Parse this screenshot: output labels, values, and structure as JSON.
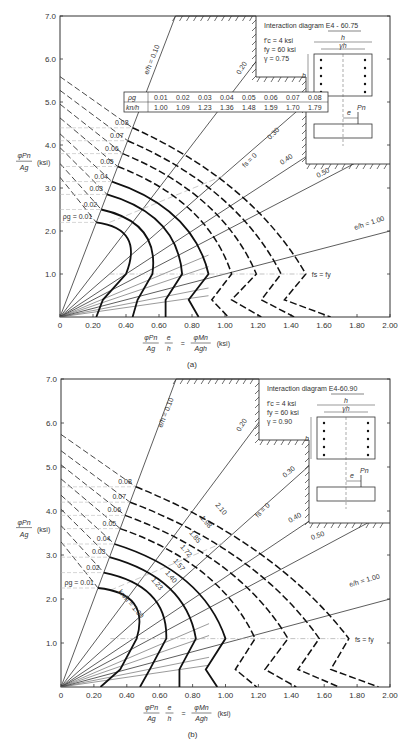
{
  "chart_data": [
    {
      "id": "a",
      "type": "line",
      "caption": "(a)",
      "title": "Interaction diagram E4 - 60.75",
      "params": [
        "f'c = 4 ksi",
        "fy = 60 ksi",
        "γ = 0.75"
      ],
      "xlabel": "φPn/Ag · e/h = φMn/(Ag h) (ksi)",
      "ylabel": "φPn/Ag (ksi)",
      "xlim": [
        0,
        2.0
      ],
      "ylim": [
        0,
        7.0
      ],
      "xticks": [
        "0",
        "0.20",
        "0.40",
        "0.60",
        "0.80",
        "1.00",
        "1.20",
        "1.40",
        "1.60",
        "1.80",
        "2.00"
      ],
      "yticks": [
        "1.0",
        "2.0",
        "3.0",
        "4.0",
        "5.0",
        "6.0",
        "7.0"
      ],
      "eh_lines": [
        {
          "label": "e/h = 0.10",
          "slope": 10.0
        },
        {
          "label": "0.20",
          "slope": 5.0
        },
        {
          "label": "0.30",
          "slope": 3.333
        },
        {
          "label": "0.40",
          "slope": 2.5
        },
        {
          "label": "0.50",
          "slope": 2.0
        },
        {
          "label": "e/h = 1.00",
          "slope": 1.0
        }
      ],
      "fs_zero_label": "fs = 0",
      "fs_fy_label": "fs = fy",
      "rho_table": {
        "rho_g": [
          "0.01",
          "0.02",
          "0.03",
          "0.04",
          "0.05",
          "0.06",
          "0.07",
          "0.08"
        ],
        "kn_h": [
          "1.00",
          "1.09",
          "1.23",
          "1.36",
          "1.48",
          "1.59",
          "1.70",
          "1.79"
        ]
      },
      "series": [
        {
          "name": "ρg = 0.01",
          "pmax": 2.2,
          "top": [
            0.22,
            2.2
          ],
          "knee": [
            0.4,
            1.0
          ],
          "low": [
            0.26,
            0.4
          ],
          "bottom": [
            0.22,
            0
          ]
        },
        {
          "name": "0.02",
          "pmax": 2.5,
          "top": [
            0.25,
            2.5
          ],
          "knee": [
            0.56,
            1.0
          ],
          "low": [
            0.47,
            0.4
          ],
          "bottom": [
            0.44,
            0
          ]
        },
        {
          "name": "0.03",
          "pmax": 2.85,
          "top": [
            0.285,
            2.85
          ],
          "knee": [
            0.74,
            1.0
          ],
          "low": [
            0.64,
            0.4
          ],
          "bottom": [
            0.64,
            0
          ]
        },
        {
          "name": "0.04",
          "pmax": 3.15,
          "top": [
            0.315,
            3.15
          ],
          "knee": [
            0.9,
            1.0
          ],
          "low": [
            0.78,
            0.4
          ],
          "bottom": [
            0.84,
            0
          ]
        },
        {
          "name": "0.05",
          "pmax": 3.5,
          "top": [
            0.35,
            3.5
          ],
          "knee": [
            1.04,
            1.0
          ],
          "low": [
            0.92,
            0.4
          ],
          "bottom": [
            1.02,
            0
          ]
        },
        {
          "name": "0.06",
          "pmax": 3.8,
          "top": [
            0.38,
            3.8
          ],
          "knee": [
            1.19,
            1.0
          ],
          "low": [
            1.04,
            0.4
          ],
          "bottom": [
            1.22,
            0
          ]
        },
        {
          "name": "0.07",
          "pmax": 4.1,
          "top": [
            0.41,
            4.1
          ],
          "knee": [
            1.34,
            1.0
          ],
          "low": [
            1.22,
            0.4
          ],
          "bottom": [
            1.42,
            0
          ]
        },
        {
          "name": "0.08",
          "pmax": 4.4,
          "top": [
            0.44,
            4.4
          ],
          "knee": [
            1.49,
            1.0
          ],
          "low": [
            1.36,
            0.4
          ],
          "bottom": [
            1.64,
            0
          ]
        }
      ],
      "kn_labels": []
    },
    {
      "id": "b",
      "type": "line",
      "caption": "(b)",
      "title": "Interaction diagram E4-60.90",
      "params": [
        "f'c = 4 ksi",
        "fy = 60 ksi",
        "γ = 0.90"
      ],
      "xlabel": "φPn/Ag · e/h = φMn/(Ag h) (ksi)",
      "ylabel": "φPn/Ag (ksi)",
      "xlim": [
        0,
        2.0
      ],
      "ylim": [
        0,
        7.0
      ],
      "xticks": [
        "0",
        "0.20",
        "0.40",
        "0.60",
        "0.80",
        "1.00",
        "1.20",
        "1.40",
        "1.60",
        "1.80",
        "2.00"
      ],
      "yticks": [
        "1.0",
        "2.0",
        "3.0",
        "4.0",
        "5.0",
        "6.0",
        "7.0"
      ],
      "eh_lines": [
        {
          "label": "e/h = 0.10",
          "slope": 10.0
        },
        {
          "label": "0.20",
          "slope": 5.0
        },
        {
          "label": "0.30",
          "slope": 3.333
        },
        {
          "label": "0.40",
          "slope": 2.5
        },
        {
          "label": "0.50",
          "slope": 2.0
        },
        {
          "label": "e/h = 1.00",
          "slope": 1.0
        }
      ],
      "fs_zero_label": "fs = 0",
      "fs_fy_label": "fs = fy",
      "rho_table": null,
      "series": [
        {
          "name": "ρg = 0.01",
          "pmax": 2.25,
          "top": [
            0.225,
            2.25
          ],
          "knee": [
            0.46,
            1.1
          ],
          "low": [
            0.36,
            0.4
          ],
          "bottom": [
            0.24,
            0
          ]
        },
        {
          "name": "0.02",
          "pmax": 2.6,
          "top": [
            0.26,
            2.6
          ],
          "knee": [
            0.64,
            1.1
          ],
          "low": [
            0.54,
            0.4
          ],
          "bottom": [
            0.48,
            0
          ]
        },
        {
          "name": "0.03",
          "pmax": 2.95,
          "top": [
            0.295,
            2.95
          ],
          "knee": [
            0.82,
            1.1
          ],
          "low": [
            0.72,
            0.4
          ],
          "bottom": [
            0.72,
            0
          ]
        },
        {
          "name": "0.04",
          "pmax": 3.25,
          "top": [
            0.325,
            3.25
          ],
          "knee": [
            1.0,
            1.1
          ],
          "low": [
            0.88,
            0.4
          ],
          "bottom": [
            0.95,
            0
          ]
        },
        {
          "name": "0.05",
          "pmax": 3.6,
          "top": [
            0.36,
            3.6
          ],
          "knee": [
            1.18,
            1.1
          ],
          "low": [
            1.06,
            0.4
          ],
          "bottom": [
            1.19,
            0
          ]
        },
        {
          "name": "0.06",
          "pmax": 3.9,
          "top": [
            0.39,
            3.9
          ],
          "knee": [
            1.38,
            1.1
          ],
          "low": [
            1.24,
            0.4
          ],
          "bottom": [
            1.43,
            0
          ]
        },
        {
          "name": "0.07",
          "pmax": 4.2,
          "top": [
            0.42,
            4.2
          ],
          "knee": [
            1.57,
            1.1
          ],
          "low": [
            1.44,
            0.4
          ],
          "bottom": [
            1.69,
            0
          ]
        },
        {
          "name": "0.08",
          "pmax": 4.55,
          "top": [
            0.455,
            4.55
          ],
          "knee": [
            1.75,
            1.1
          ],
          "low": [
            1.64,
            0.4
          ],
          "bottom": [
            1.93,
            0
          ]
        }
      ],
      "kn_labels": [
        "kn/h = 1.00",
        "1.23",
        "1.40",
        "1.57",
        "1.72",
        "1.85",
        "1.98",
        "2.10"
      ]
    }
  ]
}
